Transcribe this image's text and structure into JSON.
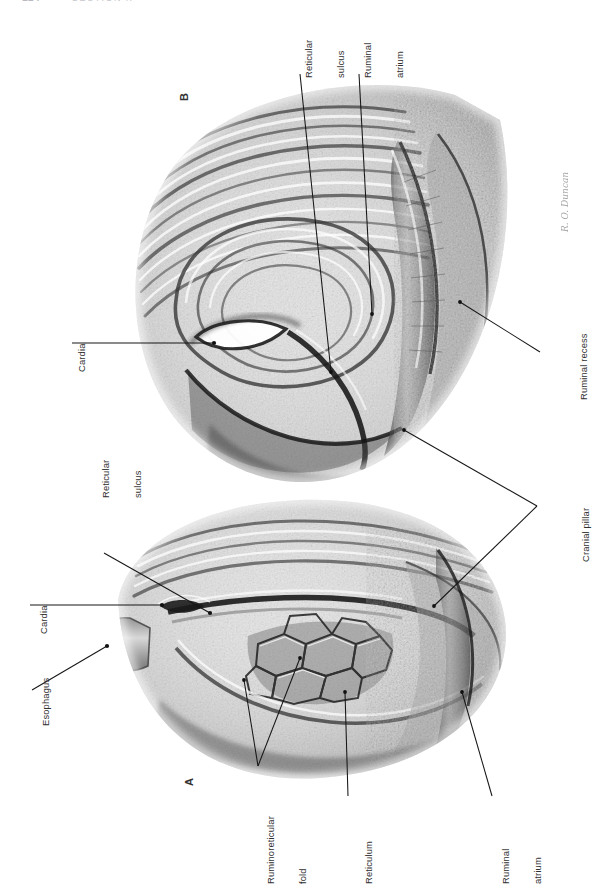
{
  "page": {
    "folio": "124",
    "running_head": "SECTION II"
  },
  "plate": {
    "figure_b_id": "B",
    "figure_a_id": "A",
    "artist_signature": "R. O. Duncan"
  },
  "labels": {
    "b_reticular_sulcus": {
      "line1": "Reticular",
      "line2": "sulcus"
    },
    "b_ruminal_atrium": {
      "line1": "Ruminal",
      "line2": "atrium"
    },
    "b_cardia": {
      "line1": "Cardia",
      "line2": ""
    },
    "b_ruminal_recess": {
      "line1": "Ruminal recess",
      "line2": ""
    },
    "cranial_pillar": {
      "line1": "Cranial pillar",
      "line2": ""
    },
    "a_reticular_sulcus": {
      "line1": "Reticular",
      "line2": "sulcus"
    },
    "a_cardia": {
      "line1": "Cardia",
      "line2": ""
    },
    "a_esophagus": {
      "line1": "Esophagus",
      "line2": ""
    },
    "a_ruminoreticular_fold": {
      "line1": "Ruminoreticular",
      "line2": "fold"
    },
    "a_reticulum": {
      "line1": "Reticulum",
      "line2": ""
    },
    "a_ruminal_atrium": {
      "line1": "Ruminal",
      "line2": "atrium"
    }
  },
  "colors": {
    "ink": "#1d1d1d",
    "label_text": "#2f2f2f",
    "folio": "#b9b9c0",
    "paper": "#ffffff"
  }
}
